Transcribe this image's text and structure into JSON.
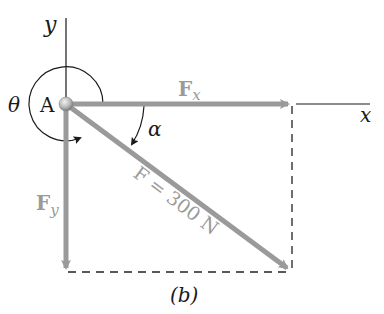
{
  "figure": {
    "caption": "(b)",
    "colors": {
      "axis": "#1a1a1a",
      "vector": "#9a9a9a",
      "dashed": "#222222",
      "point": "#b8b8b8"
    },
    "axes": {
      "y_label": "y",
      "x_label": "x"
    },
    "point": {
      "label": "A"
    },
    "angles": {
      "theta_label": "θ",
      "alpha_label": "α"
    },
    "vectors": {
      "fx_label_main": "F",
      "fx_label_sub": "x",
      "fy_label_main": "F",
      "fy_label_sub": "y",
      "f_label": "F = 300 N"
    }
  }
}
